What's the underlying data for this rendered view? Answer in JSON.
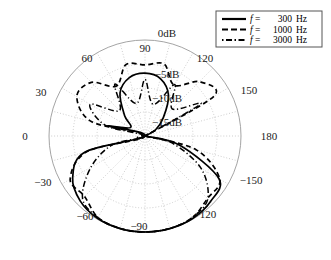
{
  "figure": {
    "title": "",
    "type": "polar-directivity-plot"
  },
  "legend": {
    "position": "top-right",
    "entries": [
      {
        "style": "solid",
        "var": "f",
        "eq": "=",
        "value": "300",
        "unit": "Hz",
        "label": "f =  300 Hz"
      },
      {
        "style": "dashed",
        "var": "f",
        "eq": "=",
        "value": "1000",
        "unit": "Hz",
        "label": "f = 1000 Hz"
      },
      {
        "style": "dashdot",
        "var": "f",
        "eq": "=",
        "value": "3000",
        "unit": "Hz",
        "label": "f = 3000 Hz"
      }
    ]
  },
  "radial_axis": {
    "labels": [
      "0dB",
      "-5dB",
      "-10dB",
      "-15dB"
    ],
    "values": [
      0,
      -5,
      -10,
      -15
    ],
    "min_db": -20,
    "max_db": 0,
    "ring_count": 4
  },
  "angular_axis": {
    "labels": [
      "-90",
      "-60",
      "-30",
      "0",
      "30",
      "60",
      "90",
      "120",
      "150",
      "180",
      "-150",
      "-120"
    ],
    "values": [
      -90,
      -60,
      -30,
      0,
      30,
      60,
      90,
      120,
      150,
      180,
      -150,
      -120
    ],
    "spoke_step_deg": 15
  },
  "chart_data": {
    "type": "line",
    "title": "",
    "xlabel": "angle (degrees)",
    "ylabel": "dB",
    "ylim": [
      -20,
      0
    ],
    "grid": true,
    "legend_position": "top-right",
    "angle_unit": "degrees",
    "categories": [
      -180,
      -165,
      -150,
      -135,
      -120,
      -105,
      -90,
      -75,
      -60,
      -45,
      -30,
      -15,
      0,
      15,
      30,
      45,
      60,
      75,
      90,
      105,
      120,
      135,
      150,
      165
    ],
    "series": [
      {
        "name": "f =  300 Hz",
        "style": "solid",
        "values": [
          -20,
          -12.5,
          -2.2,
          -0.7,
          -0.15,
          -0.02,
          0,
          -0.02,
          -0.2,
          -0.9,
          -2.6,
          -7.0,
          -20,
          -12.0,
          -16.5,
          -14.0,
          -9.6,
          -7.4,
          -6.9,
          -7.6,
          -10.2,
          -14.6,
          -17.5,
          -20
        ]
      },
      {
        "name": "f = 1000 Hz",
        "style": "dashed",
        "values": [
          -20,
          -9.0,
          -2.0,
          -1.6,
          -0.3,
          -0.05,
          0,
          -0.05,
          -0.4,
          -2.2,
          -2.0,
          -7.5,
          -20,
          -8.5,
          -3.6,
          -4.2,
          -8.0,
          -4.6,
          -5.2,
          -4.5,
          -7.8,
          -4.0,
          -3.4,
          -20
        ]
      },
      {
        "name": "f = 3000 Hz",
        "style": "dashdot",
        "values": [
          -20,
          -14.0,
          -6.5,
          -1.5,
          -0.4,
          -0.05,
          0,
          -0.05,
          -0.4,
          -1.6,
          -7.0,
          -13.0,
          -20,
          -11.5,
          -6.8,
          -12.5,
          -7.5,
          -13.0,
          -8.2,
          -13.2,
          -7.6,
          -12.0,
          -6.6,
          -20
        ]
      }
    ]
  }
}
